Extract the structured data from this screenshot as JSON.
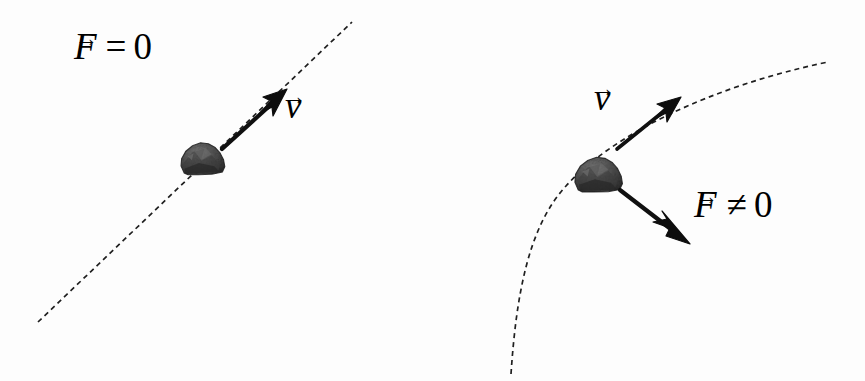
{
  "figure": {
    "background_color": "#fdfdfd",
    "ink_color": "#1a1a1a",
    "width": 865,
    "height": 381
  },
  "panels": [
    {
      "id": "left",
      "name": "zero-net-force-panel",
      "description": "Rock moving in a straight line along a dashed trajectory",
      "trajectory": {
        "name": "straight-dashed-path",
        "shape": "straight-line",
        "start": [
          38,
          322
        ],
        "end": [
          352,
          22
        ],
        "dash": "5 4",
        "stroke_width": 1.7,
        "color": "#1f1f1f"
      },
      "body": {
        "name": "rock",
        "center": [
          201,
          160
        ],
        "width": 46,
        "height": 32,
        "fill": "#4a4a4a"
      },
      "vectors": [
        {
          "name": "velocity-arrow",
          "symbol": "v",
          "from": [
            222,
            149
          ],
          "to": [
            286,
            91
          ],
          "stroke_width": 4.2,
          "color": "#101010"
        }
      ],
      "labels": {
        "force": {
          "symbol": "F",
          "relation": "=",
          "value": "0",
          "full": "F = 0"
        },
        "velocity": {
          "symbol": "v",
          "full": "v"
        }
      }
    },
    {
      "id": "right",
      "name": "nonzero-net-force-panel",
      "description": "Rock moving along a curved dashed trajectory, velocity tangent and force pointing inward",
      "trajectory": {
        "name": "curved-dashed-path",
        "shape": "curve",
        "start": [
          511,
          374
        ],
        "control_points": [
          [
            523,
            250
          ],
          [
            560,
            160
          ],
          [
            828,
            62
          ]
        ],
        "end": [
          828,
          62
        ],
        "dash": "5 4",
        "stroke_width": 1.7,
        "color": "#1f1f1f"
      },
      "body": {
        "name": "rock",
        "center": [
          597,
          175
        ],
        "width": 50,
        "height": 35,
        "fill": "#4a4a4a"
      },
      "vectors": [
        {
          "name": "velocity-arrow",
          "symbol": "v",
          "from": [
            617,
            149
          ],
          "to": [
            680,
            98
          ],
          "stroke_width": 3.6,
          "color": "#101010"
        },
        {
          "name": "force-arrow",
          "symbol": "F",
          "from": [
            620,
            190
          ],
          "to": [
            688,
            242
          ],
          "stroke_width": 4.2,
          "color": "#101010"
        }
      ],
      "labels": {
        "velocity": {
          "symbol": "v",
          "full": "v"
        },
        "force": {
          "symbol": "F",
          "relation": "≠",
          "value": "0",
          "full": "F ≠ 0"
        }
      }
    }
  ],
  "glyphs": {
    "vector_arrow": "→"
  }
}
